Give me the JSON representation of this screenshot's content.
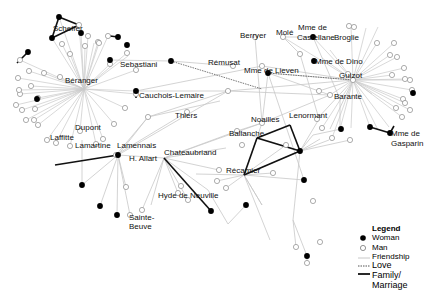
{
  "legend": {
    "title": "Legend",
    "woman": "Woman",
    "man": "Man",
    "friendship": "Friendship",
    "love": "Love",
    "family": "Family/",
    "family2": "Marriage"
  },
  "colors": {
    "friendship": "#c8c8c8",
    "love": "#555555",
    "family": "#111111",
    "woman": "#000000",
    "man": "#ffffff"
  },
  "labels": [
    {
      "text": "Scheffer",
      "x": 53,
      "y": 28
    },
    {
      "text": "Sebastiani",
      "x": 120,
      "y": 64
    },
    {
      "text": "Béranger",
      "x": 65,
      "y": 80
    },
    {
      "text": "Cauchois-Lemaire",
      "x": 139,
      "y": 95
    },
    {
      "text": "Thiers",
      "x": 175,
      "y": 115
    },
    {
      "text": "Dupont",
      "x": 75,
      "y": 127
    },
    {
      "text": "Laffitte",
      "x": 50,
      "y": 137
    },
    {
      "text": "Lamartine",
      "x": 75,
      "y": 145
    },
    {
      "text": "Lamennais",
      "x": 117,
      "y": 145
    },
    {
      "text": "H. Allart",
      "x": 129,
      "y": 158
    },
    {
      "text": "Chateaubriand",
      "x": 164,
      "y": 152
    },
    {
      "text": "Hyde de Neuville",
      "x": 158,
      "y": 195
    },
    {
      "text": "Sainte-",
      "x": 129,
      "y": 217
    },
    {
      "text": "Beuve",
      "x": 129,
      "y": 226
    },
    {
      "text": "Rémusat",
      "x": 208,
      "y": 62
    },
    {
      "text": "Berryer",
      "x": 240,
      "y": 35
    },
    {
      "text": "Molé",
      "x": 276,
      "y": 32
    },
    {
      "text": "Mme de",
      "x": 298,
      "y": 27
    },
    {
      "text": "Castellane",
      "x": 297,
      "y": 37
    },
    {
      "text": "Broglie",
      "x": 334,
      "y": 37
    },
    {
      "text": "Mme de Dino",
      "x": 315,
      "y": 61
    },
    {
      "text": "Mme de Lieven",
      "x": 244,
      "y": 70
    },
    {
      "text": "Guizot",
      "x": 339,
      "y": 75
    },
    {
      "text": "Barante",
      "x": 334,
      "y": 96
    },
    {
      "text": "Lenormant",
      "x": 289,
      "y": 115
    },
    {
      "text": "Noailles",
      "x": 251,
      "y": 119
    },
    {
      "text": "Ballanche",
      "x": 229,
      "y": 133
    },
    {
      "text": "Récamier",
      "x": 226,
      "y": 170
    },
    {
      "text": "Mme de",
      "x": 391,
      "y": 133
    },
    {
      "text": "Gasparin",
      "x": 391,
      "y": 143
    }
  ],
  "hubs": [
    {
      "id": "beranger",
      "x": 84,
      "y": 89,
      "type": "man",
      "spokes": [
        [
          59,
          17
        ],
        [
          79,
          25
        ],
        [
          52,
          38
        ],
        [
          88,
          36
        ],
        [
          108,
          36
        ],
        [
          98,
          42
        ],
        [
          99,
          43
        ],
        [
          127,
          53
        ],
        [
          110,
          64
        ],
        [
          60,
          77
        ],
        [
          44,
          73
        ],
        [
          20,
          60
        ],
        [
          18,
          78
        ],
        [
          29,
          71
        ],
        [
          20,
          94
        ],
        [
          19,
          90
        ],
        [
          31,
          86
        ],
        [
          16,
          105
        ],
        [
          38,
          98
        ],
        [
          22,
          110
        ],
        [
          35,
          109
        ],
        [
          26,
          120
        ],
        [
          34,
          120
        ],
        [
          38,
          125
        ],
        [
          47,
          140
        ],
        [
          56,
          143
        ],
        [
          70,
          146
        ],
        [
          80,
          131
        ],
        [
          96,
          144
        ],
        [
          103,
          139
        ],
        [
          114,
          124
        ],
        [
          125,
          108
        ],
        [
          135,
          91
        ],
        [
          136,
          94
        ],
        [
          136,
          70
        ],
        [
          128,
          56
        ],
        [
          85,
          46
        ],
        [
          94,
          43
        ],
        [
          62,
          44
        ],
        [
          81,
          33
        ],
        [
          70,
          54
        ]
      ]
    },
    {
      "id": "guizot",
      "x": 353,
      "y": 80,
      "type": "man",
      "spokes": [
        [
          351,
          26
        ],
        [
          366,
          28
        ],
        [
          378,
          27
        ],
        [
          377,
          43
        ],
        [
          394,
          43
        ],
        [
          390,
          55
        ],
        [
          397,
          57
        ],
        [
          404,
          68
        ],
        [
          392,
          75
        ],
        [
          410,
          80
        ],
        [
          405,
          79
        ],
        [
          412,
          90
        ],
        [
          403,
          99
        ],
        [
          405,
          103
        ],
        [
          396,
          108
        ],
        [
          410,
          110
        ],
        [
          402,
          117
        ],
        [
          372,
          94
        ],
        [
          378,
          130
        ],
        [
          370,
          127
        ],
        [
          389,
          127
        ],
        [
          351,
          128
        ],
        [
          340,
          129
        ],
        [
          332,
          138
        ],
        [
          322,
          128
        ],
        [
          330,
          95
        ],
        [
          322,
          58
        ],
        [
          330,
          50
        ],
        [
          313,
          37
        ],
        [
          283,
          37
        ]
      ]
    }
  ],
  "women": [
    [
      59,
      17
    ],
    [
      52,
      38
    ],
    [
      81,
      33
    ],
    [
      118,
      37
    ],
    [
      28,
      52
    ],
    [
      110,
      60
    ],
    [
      37,
      99
    ],
    [
      136,
      91
    ],
    [
      171,
      61
    ],
    [
      127,
      45
    ],
    [
      313,
      37
    ],
    [
      314,
      61
    ],
    [
      268,
      73
    ],
    [
      413,
      93
    ],
    [
      370,
      127
    ],
    [
      390,
      133
    ],
    [
      304,
      180
    ],
    [
      300,
      151
    ],
    [
      118,
      155
    ],
    [
      82,
      185
    ],
    [
      100,
      206
    ],
    [
      117,
      215
    ],
    [
      211,
      211
    ],
    [
      246,
      205
    ],
    [
      307,
      256
    ],
    [
      341,
      129
    ]
  ],
  "men": [
    [
      79,
      25
    ],
    [
      88,
      36
    ],
    [
      108,
      36
    ],
    [
      98,
      42
    ],
    [
      99,
      43
    ],
    [
      127,
      53
    ],
    [
      110,
      64
    ],
    [
      60,
      77
    ],
    [
      44,
      73
    ],
    [
      20,
      60
    ],
    [
      18,
      78
    ],
    [
      29,
      71
    ],
    [
      20,
      94
    ],
    [
      19,
      90
    ],
    [
      31,
      86
    ],
    [
      16,
      105
    ],
    [
      38,
      98
    ],
    [
      22,
      110
    ],
    [
      35,
      109
    ],
    [
      26,
      120
    ],
    [
      34,
      120
    ],
    [
      38,
      125
    ],
    [
      47,
      140
    ],
    [
      56,
      143
    ],
    [
      70,
      146
    ],
    [
      80,
      131
    ],
    [
      96,
      144
    ],
    [
      103,
      139
    ],
    [
      114,
      124
    ],
    [
      125,
      108
    ],
    [
      136,
      94
    ],
    [
      136,
      70
    ],
    [
      85,
      46
    ],
    [
      62,
      44
    ],
    [
      70,
      54
    ],
    [
      126,
      187
    ],
    [
      116,
      155
    ],
    [
      148,
      117
    ],
    [
      187,
      112
    ],
    [
      233,
      66
    ],
    [
      255,
      37
    ],
    [
      283,
      37
    ],
    [
      349,
      26
    ],
    [
      354,
      27
    ],
    [
      300,
      54
    ],
    [
      348,
      74
    ],
    [
      353,
      80
    ],
    [
      377,
      43
    ],
    [
      394,
      43
    ],
    [
      390,
      55
    ],
    [
      397,
      57
    ],
    [
      404,
      68
    ],
    [
      392,
      75
    ],
    [
      410,
      80
    ],
    [
      405,
      79
    ],
    [
      412,
      90
    ],
    [
      403,
      99
    ],
    [
      405,
      103
    ],
    [
      396,
      108
    ],
    [
      410,
      110
    ],
    [
      402,
      117
    ],
    [
      332,
      138
    ],
    [
      322,
      128
    ],
    [
      330,
      95
    ],
    [
      228,
      91
    ],
    [
      262,
      123
    ],
    [
      317,
      119
    ],
    [
      319,
      91
    ],
    [
      237,
      131
    ],
    [
      242,
      145
    ],
    [
      219,
      170
    ],
    [
      273,
      173
    ],
    [
      226,
      188
    ],
    [
      217,
      181
    ],
    [
      181,
      186
    ],
    [
      178,
      193
    ],
    [
      188,
      200
    ],
    [
      142,
      210
    ],
    [
      130,
      215
    ],
    [
      313,
      201
    ],
    [
      296,
      247
    ],
    [
      307,
      263
    ],
    [
      320,
      242
    ],
    [
      262,
      66
    ],
    [
      286,
      145
    ],
    [
      350,
      140
    ]
  ],
  "friend_edges": [
    [
      171,
      61,
      233,
      66
    ],
    [
      171,
      61,
      110,
      60
    ],
    [
      136,
      91,
      228,
      91
    ],
    [
      136,
      91,
      262,
      66
    ],
    [
      148,
      117,
      228,
      91
    ],
    [
      148,
      117,
      220,
      101
    ],
    [
      148,
      117,
      118,
      155
    ],
    [
      116,
      155,
      187,
      112
    ],
    [
      116,
      155,
      148,
      117
    ],
    [
      118,
      155,
      228,
      91
    ],
    [
      118,
      155,
      164,
      158
    ],
    [
      164,
      158,
      226,
      148
    ],
    [
      164,
      158,
      262,
      123
    ],
    [
      164,
      158,
      237,
      131
    ],
    [
      164,
      158,
      219,
      170
    ],
    [
      164,
      158,
      142,
      210
    ],
    [
      164,
      158,
      151,
      205
    ],
    [
      164,
      158,
      178,
      193
    ],
    [
      164,
      158,
      188,
      200
    ],
    [
      164,
      158,
      208,
      190
    ],
    [
      208,
      190,
      228,
      224
    ],
    [
      228,
      224,
      246,
      205
    ],
    [
      118,
      155,
      100,
      206
    ],
    [
      118,
      155,
      117,
      215
    ],
    [
      118,
      155,
      130,
      215
    ],
    [
      118,
      155,
      82,
      185
    ],
    [
      118,
      155,
      126,
      187
    ],
    [
      82,
      140,
      82,
      185
    ],
    [
      255,
      37,
      262,
      123
    ],
    [
      283,
      37,
      300,
      54
    ],
    [
      283,
      37,
      313,
      37
    ],
    [
      268,
      73,
      353,
      80
    ],
    [
      262,
      66,
      268,
      73
    ],
    [
      262,
      66,
      353,
      80
    ],
    [
      268,
      73,
      330,
      95
    ],
    [
      268,
      73,
      304,
      180
    ],
    [
      228,
      91,
      353,
      80
    ],
    [
      228,
      91,
      330,
      95
    ],
    [
      262,
      123,
      330,
      95
    ],
    [
      262,
      123,
      268,
      73
    ],
    [
      237,
      131,
      300,
      151
    ],
    [
      237,
      131,
      262,
      123
    ],
    [
      244,
      175,
      300,
      151
    ],
    [
      244,
      175,
      286,
      145
    ],
    [
      244,
      175,
      273,
      173
    ],
    [
      244,
      175,
      226,
      188
    ],
    [
      244,
      175,
      217,
      181
    ],
    [
      244,
      175,
      304,
      180
    ],
    [
      244,
      175,
      262,
      205
    ],
    [
      262,
      205,
      244,
      175
    ],
    [
      244,
      175,
      270,
      240
    ],
    [
      300,
      151,
      313,
      135
    ],
    [
      300,
      151,
      320,
      139
    ],
    [
      300,
      151,
      350,
      140
    ],
    [
      300,
      151,
      319,
      119
    ],
    [
      300,
      151,
      329,
      140
    ],
    [
      300,
      151,
      293,
      220
    ],
    [
      293,
      220,
      296,
      247
    ],
    [
      293,
      220,
      307,
      256
    ],
    [
      307,
      256,
      307,
      263
    ],
    [
      317,
      119,
      353,
      80
    ],
    [
      319,
      91,
      353,
      80
    ],
    [
      340,
      99,
      340,
      129
    ],
    [
      341,
      129,
      313,
      135
    ],
    [
      353,
      80,
      330,
      129
    ],
    [
      196,
      174,
      244,
      175
    ],
    [
      262,
      123,
      244,
      175
    ],
    [
      313,
      37,
      340,
      99
    ],
    [
      300,
      54,
      319,
      119
    ]
  ],
  "love_edges": [
    [
      171,
      61,
      262,
      89
    ],
    [
      268,
      73,
      353,
      80
    ]
  ],
  "family_edges": [
    [
      59,
      17,
      52,
      38
    ],
    [
      52,
      38,
      79,
      25
    ],
    [
      59,
      17,
      79,
      25
    ],
    [
      110,
      36,
      118,
      37
    ],
    [
      28,
      52,
      17,
      63
    ],
    [
      136,
      91,
      136,
      98
    ],
    [
      55,
      165,
      118,
      155
    ],
    [
      164,
      158,
      211,
      211
    ],
    [
      244,
      175,
      300,
      151
    ],
    [
      300,
      151,
      290,
      125
    ],
    [
      290,
      125,
      257,
      138
    ],
    [
      257,
      138,
      300,
      151
    ],
    [
      244,
      175,
      257,
      138
    ],
    [
      370,
      127,
      390,
      133
    ],
    [
      394,
      126,
      390,
      133
    ]
  ]
}
